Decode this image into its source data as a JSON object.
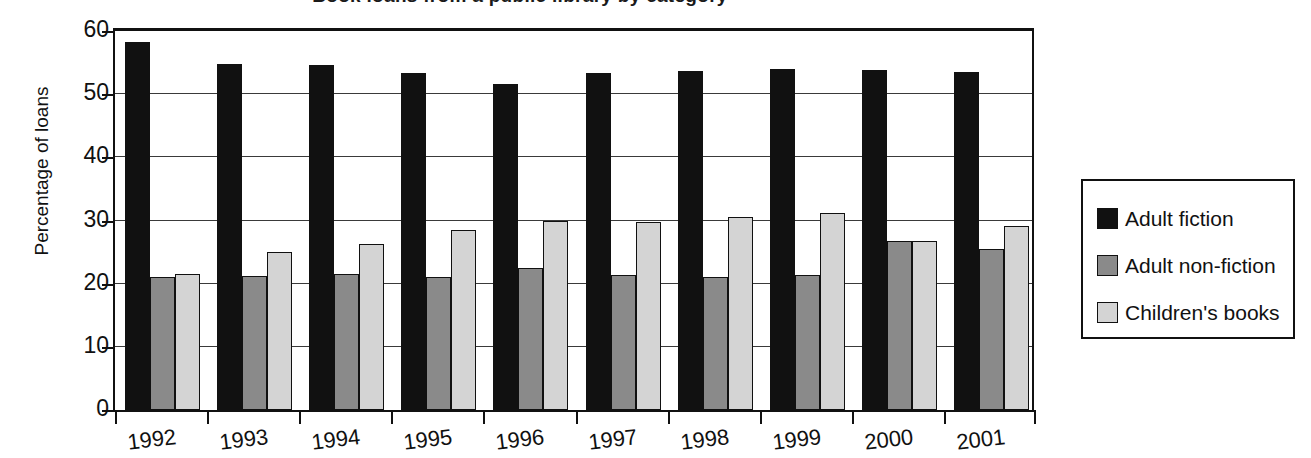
{
  "chart_data": {
    "type": "bar",
    "title": "Book loans from a public library by category",
    "title_visible": "cropped at top edge of screenshot",
    "xlabel": "",
    "ylabel": "Percentage of loans",
    "categories": [
      "1992",
      "1993",
      "1994",
      "1995",
      "1996",
      "1997",
      "1998",
      "1999",
      "2000",
      "2001"
    ],
    "ylim": [
      0,
      60
    ],
    "yticks": [
      0,
      10,
      20,
      30,
      40,
      50,
      60
    ],
    "grid": "horizontal",
    "legend_position": "right",
    "series": [
      {
        "name": "Adult fiction",
        "color": "#111111",
        "values": [
          58.2,
          54.8,
          54.6,
          53.4,
          51.6,
          53.4,
          53.6,
          54.0,
          53.8,
          53.5
        ]
      },
      {
        "name": "Adult non-fiction",
        "color": "#8a8a8a",
        "values": [
          21.0,
          21.2,
          21.5,
          21.0,
          22.5,
          21.4,
          21.0,
          21.4,
          26.8,
          25.5
        ]
      },
      {
        "name": "Children's books",
        "color": "#d4d4d4",
        "values": [
          21.5,
          25.0,
          26.3,
          28.5,
          30.0,
          29.8,
          30.6,
          31.2,
          26.8,
          29.2
        ]
      }
    ]
  },
  "axis": {
    "y_title": "Percentage of loans",
    "y_tick_labels": [
      "0",
      "10",
      "20",
      "30",
      "40",
      "50",
      "60"
    ]
  },
  "legend": {
    "items": [
      {
        "label": "Adult fiction",
        "swatch": "black-square-icon"
      },
      {
        "label": "Adult non-fiction",
        "swatch": "gray-square-icon"
      },
      {
        "label": "Children's books",
        "swatch": "light-gray-square-icon"
      }
    ]
  }
}
